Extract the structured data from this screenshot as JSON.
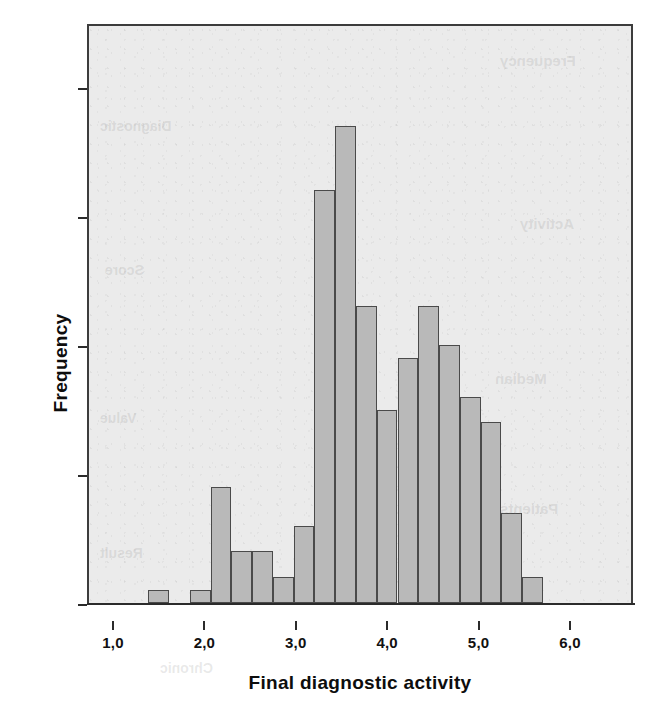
{
  "chart_data": {
    "type": "bar",
    "subtype": "histogram",
    "title": "",
    "xlabel": "Final diagnostic activity",
    "ylabel": "Frequency",
    "xlim": [
      0.72,
      6.68
    ],
    "ylim": [
      0,
      45
    ],
    "grid": false,
    "legend": null,
    "bin_width": 0.2273,
    "bar_color": "#b9b9b9",
    "bar_edge_color": "#4a4a4a",
    "plot_background": "#ebebeb",
    "axis_color": "#2b2b2b",
    "x_tick_labels": [
      "1,0",
      "2,0",
      "3,0",
      "4,0",
      "5,0",
      "6,0"
    ],
    "x_tick_values": [
      1.0,
      2.0,
      3.0,
      4.0,
      5.0,
      6.0
    ],
    "y_tick_labels": [
      "0,0",
      "10,0",
      "20,0",
      "30,0",
      "40,0"
    ],
    "y_tick_values": [
      0,
      10,
      20,
      30,
      40
    ],
    "bins": [
      {
        "left": 1.3636,
        "right": 1.5909,
        "center": 1.477,
        "value": 1
      },
      {
        "left": 1.5909,
        "right": 1.8182,
        "center": 1.705,
        "value": 0
      },
      {
        "left": 1.8182,
        "right": 2.0455,
        "center": 1.932,
        "value": 1
      },
      {
        "left": 2.0455,
        "right": 2.2727,
        "center": 2.159,
        "value": 9
      },
      {
        "left": 2.2727,
        "right": 2.5,
        "center": 2.386,
        "value": 4
      },
      {
        "left": 2.5,
        "right": 2.7273,
        "center": 2.614,
        "value": 4
      },
      {
        "left": 2.7273,
        "right": 2.9545,
        "center": 2.841,
        "value": 2
      },
      {
        "left": 2.9545,
        "right": 3.1818,
        "center": 3.068,
        "value": 6
      },
      {
        "left": 3.1818,
        "right": 3.4091,
        "center": 3.295,
        "value": 32
      },
      {
        "left": 3.4091,
        "right": 3.6364,
        "center": 3.523,
        "value": 37
      },
      {
        "left": 3.6364,
        "right": 3.8636,
        "center": 3.75,
        "value": 23
      },
      {
        "left": 3.8636,
        "right": 4.0909,
        "center": 3.977,
        "value": 15
      },
      {
        "left": 4.0909,
        "right": 4.3182,
        "center": 4.205,
        "value": 19
      },
      {
        "left": 4.3182,
        "right": 4.5455,
        "center": 4.432,
        "value": 23
      },
      {
        "left": 4.5455,
        "right": 4.7727,
        "center": 4.659,
        "value": 20
      },
      {
        "left": 4.7727,
        "right": 5.0,
        "center": 4.886,
        "value": 16
      },
      {
        "left": 5.0,
        "right": 5.2273,
        "center": 5.114,
        "value": 14
      },
      {
        "left": 5.2273,
        "right": 5.4545,
        "center": 5.341,
        "value": 7
      },
      {
        "left": 5.4545,
        "right": 5.6818,
        "center": 5.568,
        "value": 2
      }
    ],
    "categories": [
      "1,48",
      "1,70",
      "1,93",
      "2,16",
      "2,39",
      "2,61",
      "2,84",
      "3,07",
      "3,30",
      "3,52",
      "3,75",
      "3,98",
      "4,20",
      "4,43",
      "4,66",
      "4,89",
      "5,11",
      "5,34",
      "5,57"
    ],
    "values": [
      1,
      0,
      1,
      9,
      4,
      4,
      2,
      6,
      32,
      37,
      23,
      15,
      19,
      23,
      20,
      16,
      14,
      7,
      2
    ]
  }
}
